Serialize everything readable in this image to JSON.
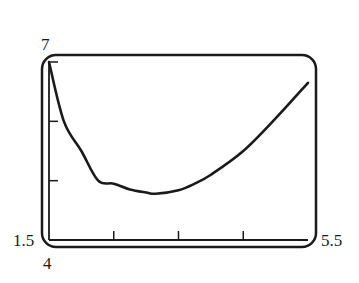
{
  "chart_data": {
    "type": "line",
    "title": "",
    "xlabel": "",
    "ylabel": "",
    "xlim": [
      1.5,
      5.5
    ],
    "ylim": [
      4,
      7
    ],
    "x_ticks": [
      1.5,
      2.5,
      3.5,
      4.5,
      5.5
    ],
    "y_ticks": [
      4,
      5,
      6,
      7
    ],
    "tick_labels": {
      "x_min": "1.5",
      "x_max": "5.5",
      "y_min": "4",
      "y_max": "7"
    },
    "grid": false,
    "legend": null,
    "series": [
      {
        "name": "curve",
        "x": [
          1.5,
          1.73,
          2.0,
          2.26,
          2.5,
          2.75,
          3.0,
          3.15,
          3.5,
          3.75,
          4.0,
          4.5,
          5.0,
          5.5
        ],
        "y": [
          7.0,
          6.0,
          5.5,
          5.0,
          4.95,
          4.85,
          4.8,
          4.78,
          4.84,
          4.95,
          5.1,
          5.5,
          6.05,
          6.65
        ]
      }
    ],
    "color": "#1a1a1a"
  }
}
